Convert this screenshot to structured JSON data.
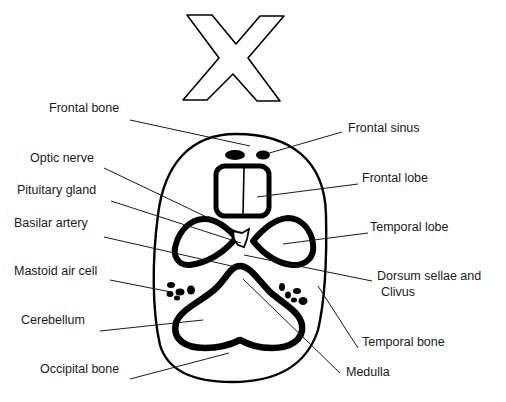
{
  "title_mark": "X",
  "colors": {
    "ink": "#000000",
    "background": "#ffffff",
    "text": "#1a1a1a"
  },
  "labels_left": [
    {
      "id": "frontal-bone",
      "text": "Frontal bone",
      "x": 49,
      "y": 108
    },
    {
      "id": "optic-nerve",
      "text": "Optic nerve",
      "x": 30,
      "y": 158
    },
    {
      "id": "pituitary-gland",
      "text": "Pituitary gland",
      "x": 17,
      "y": 190
    },
    {
      "id": "basilar-artery",
      "text": "Basilar artery",
      "x": 14,
      "y": 223
    },
    {
      "id": "mastoid-air-cell",
      "text": "Mastoid air cell",
      "x": 14,
      "y": 271
    },
    {
      "id": "cerebellum",
      "text": "Cerebellum",
      "x": 21,
      "y": 320
    },
    {
      "id": "occipital-bone",
      "text": "Occipital bone",
      "x": 40,
      "y": 369
    }
  ],
  "labels_right": [
    {
      "id": "frontal-sinus",
      "text": "Frontal sinus",
      "x": 348,
      "y": 128
    },
    {
      "id": "frontal-lobe",
      "text": "Frontal lobe",
      "x": 362,
      "y": 178
    },
    {
      "id": "temporal-lobe",
      "text": "Temporal lobe",
      "x": 370,
      "y": 228
    },
    {
      "id": "dorsum-sellae",
      "text": "Dorsum sellae and",
      "x": 377,
      "y": 276
    },
    {
      "id": "clivus",
      "text": "Clivus",
      "x": 381,
      "y": 292
    },
    {
      "id": "temporal-bone",
      "text": "Temporal bone",
      "x": 362,
      "y": 342
    },
    {
      "id": "medulla",
      "text": "Medulla",
      "x": 346,
      "y": 372
    }
  ]
}
